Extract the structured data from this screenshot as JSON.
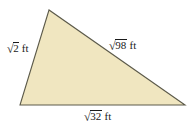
{
  "figure": {
    "name": "scalene-triangle-with-radical-side-lengths",
    "type": "geometry-diagram",
    "shape": "triangle",
    "background_color": "#ffffff",
    "fill_color": "#f0e6c0",
    "stroke_color": "#5c5a4a",
    "stroke_width": 1,
    "vertices": [
      {
        "name": "apex",
        "x": 49,
        "y": 10
      },
      {
        "name": "bottom-left",
        "x": 20,
        "y": 105
      },
      {
        "name": "bottom-right",
        "x": 185,
        "y": 105
      }
    ],
    "labels": {
      "left_side": {
        "radical_sign": "√",
        "radicand": "2",
        "unit": "ft",
        "full_text": "√2 ft"
      },
      "hypotenuse": {
        "radical_sign": "√",
        "radicand": "98",
        "unit": "ft",
        "full_text": "√98 ft"
      },
      "base": {
        "radical_sign": "√",
        "radicand": "32",
        "unit": "ft",
        "full_text": "√32 ft"
      }
    }
  }
}
